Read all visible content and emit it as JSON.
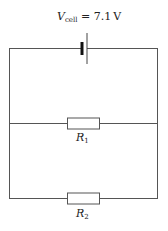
{
  "diagram": {
    "type": "circuit",
    "cell": {
      "symbol": "V",
      "subscript": "cell",
      "equals": "=",
      "value": "7.1",
      "unit": "V",
      "label_full": "V_cell = 7.1 V"
    },
    "resistors": [
      {
        "symbol": "R",
        "subscript": "1",
        "label_full": "R_1"
      },
      {
        "symbol": "R",
        "subscript": "2",
        "label_full": "R_2"
      }
    ],
    "topology": "Cell in series with parallel combination of R1 and R2"
  }
}
